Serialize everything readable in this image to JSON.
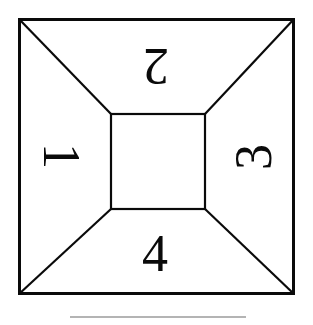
{
  "figure": {
    "name": "square-with-inscribed-square-four-numbered-faces",
    "background_color": "#ffffff",
    "stroke_color": "#0a0a0a",
    "outer_stroke_width": 3,
    "inner_stroke_width": 2,
    "diagonal_stroke_width": 2,
    "rule_color": "#b4b4b4"
  },
  "geometry": {
    "outer_square": {
      "x": 18,
      "y": 18,
      "width": 277,
      "height": 277
    },
    "inner_square": {
      "x": 110,
      "y": 113,
      "width": 96,
      "height": 97
    },
    "diagonals": [
      {
        "name": "top-left-diagonal",
        "from": [
          18,
          18
        ],
        "to": [
          110,
          113
        ]
      },
      {
        "name": "top-right-diagonal",
        "from": [
          295,
          18
        ],
        "to": [
          206,
          113
        ]
      },
      {
        "name": "bottom-left-diagonal",
        "from": [
          18,
          295
        ],
        "to": [
          110,
          210
        ]
      },
      {
        "name": "bottom-right-diagonal",
        "from": [
          295,
          295
        ],
        "to": [
          206,
          210
        ]
      }
    ]
  },
  "labels": {
    "left": {
      "text": "1",
      "rotation_deg": 90,
      "face": "left-face"
    },
    "top": {
      "text": "2",
      "rotation_deg": 180,
      "face": "top-face"
    },
    "right": {
      "text": "3",
      "rotation_deg": -90,
      "face": "right-face"
    },
    "bottom": {
      "text": "4",
      "rotation_deg": 0,
      "face": "bottom-face"
    }
  },
  "caption_rule": {
    "visible": true,
    "x": 70,
    "y": 316,
    "width": 176,
    "color": "#b4b4b4"
  }
}
